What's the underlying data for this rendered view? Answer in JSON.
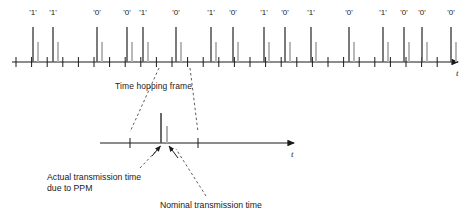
{
  "figure": {
    "type": "time-hopping-ppm-pulse-train-diagram",
    "axis_label": "t"
  },
  "upper_train": {
    "axis": {
      "x_start": 12,
      "x_end": 452,
      "y": 62,
      "label": "t"
    },
    "tick_spacing": 15.6,
    "tick_count": 28,
    "tick_half_height": 5,
    "bits": [
      {
        "label": "'1'",
        "actual_x": 33,
        "nominal_x": 38,
        "label_x": 33
      },
      {
        "label": "'1'",
        "actual_x": 53,
        "nominal_x": 58,
        "label_x": 53
      },
      {
        "label": "'0'",
        "actual_x": 97,
        "nominal_x": 102,
        "label_x": 97
      },
      {
        "label": "'0'",
        "actual_x": 127,
        "nominal_x": 132,
        "label_x": 127
      },
      {
        "label": "'1'",
        "actual_x": 143,
        "nominal_x": 148,
        "label_x": 143
      },
      {
        "label": "'0'",
        "actual_x": 176,
        "nominal_x": 181,
        "label_x": 176
      },
      {
        "label": "'1'",
        "actual_x": 211,
        "nominal_x": 216,
        "label_x": 211
      },
      {
        "label": "'0'",
        "actual_x": 233,
        "nominal_x": 238,
        "label_x": 233
      },
      {
        "label": "'1'",
        "actual_x": 264,
        "nominal_x": 269,
        "label_x": 264
      },
      {
        "label": "'0'",
        "actual_x": 285,
        "nominal_x": 290,
        "label_x": 285
      },
      {
        "label": "'1'",
        "actual_x": 311,
        "nominal_x": 316,
        "label_x": 311
      },
      {
        "label": "'0'",
        "actual_x": 349,
        "nominal_x": 354,
        "label_x": 349
      },
      {
        "label": "'1'",
        "actual_x": 383,
        "nominal_x": 388,
        "label_x": 383
      },
      {
        "label": "'0'",
        "actual_x": 404,
        "nominal_x": 409,
        "label_x": 404
      },
      {
        "label": "'0'",
        "actual_x": 422,
        "nominal_x": 427,
        "label_x": 422
      },
      {
        "label": "'0'",
        "actual_x": 451,
        "nominal_x": 456,
        "label_x": 451
      }
    ],
    "actual_pulse_height": 35,
    "nominal_pulse_height": 20,
    "bit_label_y": 8
  },
  "lower_frame": {
    "axis": {
      "x_start": 100,
      "x_end": 288,
      "y": 143,
      "label": "t"
    },
    "ticks": [
      130,
      198
    ],
    "tick_half_height": 5,
    "actual_pulse": {
      "x": 161,
      "height": 30
    },
    "nominal_pulse": {
      "x": 167,
      "height": 17
    }
  },
  "annotations": {
    "frame_label": "Time hopping frame",
    "frame_label_x": 115,
    "frame_label_y": 81,
    "actual_label_line1": "Actual transmission time",
    "actual_label_line2": "due to PPM",
    "actual_label_x": 47,
    "actual_label_y": 172,
    "nominal_label": "Nominal transmission time",
    "nominal_label_x": 160,
    "nominal_label_y": 200
  },
  "colors": {
    "axis": "#1a1a1a",
    "actual_pulse": "#5a5a5a",
    "nominal_pulse": "#b0b0b0",
    "text": "#1a1a1a",
    "leader": "#4a4a4a"
  }
}
